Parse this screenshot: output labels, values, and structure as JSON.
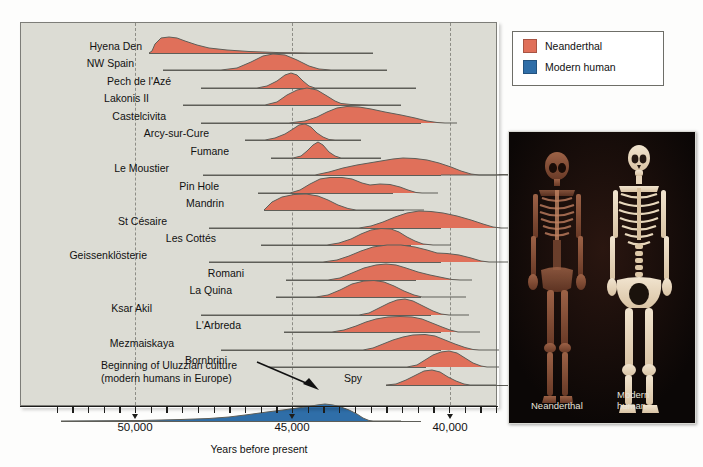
{
  "figure": {
    "axis_title": "Years before present",
    "background_color": "#dcdcd4",
    "neanderthal_color": "#e0705a",
    "modern_human_color": "#2f6ea8",
    "baseline_color": "#5e5e58"
  },
  "legend": {
    "items": [
      {
        "label": "Neanderthal",
        "color": "#e0705a"
      },
      {
        "label": "Modern human",
        "color": "#2f6ea8"
      }
    ]
  },
  "annotation": {
    "line1": "Beginning of Uluzzian culture",
    "line2": "(modern humans in Europe)"
  },
  "photo": {
    "left_caption": "Neanderthal",
    "right_caption_line1": "Modern",
    "right_caption_line2": "human"
  },
  "chart_data": {
    "type": "area",
    "title": "",
    "xlabel": "Years before present",
    "ylabel": "",
    "xlim": [
      52300,
      38600
    ],
    "x_reversed": true,
    "grid": true,
    "gridlines": [
      50000,
      45000,
      40000
    ],
    "tick_labels": [
      "50,000",
      "45,000",
      "40,000"
    ],
    "tick_values": [
      50000,
      45000,
      40000
    ],
    "minor_tick_interval": 500,
    "legend_position": "top-right",
    "series": [
      {
        "name": "Hyena Den",
        "group": "Neanderthal",
        "color": "#e0705a",
        "label_x": 123,
        "baseline": [
          128,
          352
        ],
        "peak": 49700,
        "points": "0,21 3,19 6,12 12,6 20,5 28,6 36,9 48,13 60,16 78,18 100,19.5 130,20.6 160,21 224,21"
      },
      {
        "name": "NW Spain",
        "group": "Neanderthal",
        "color": "#e0705a",
        "label_x": 115,
        "baseline": [
          142,
          366
        ],
        "peak": 47600,
        "points": "0,21 58,21 74,19 88,13 100,7 110,5 122,6 134,11 146,17 156,20 168,21 224,21"
      },
      {
        "name": "Pech de l'Azé",
        "group": "Neanderthal",
        "color": "#e0705a",
        "label_x": 152,
        "baseline": [
          180,
          395
        ],
        "peak": 47200,
        "points": "0,21 56,21 66,19 76,14 84,8 90,6 96,8 102,14 108,19 114,21 215,21"
      },
      {
        "name": "Lakonis II",
        "group": "Neanderthal",
        "color": "#e0705a",
        "label_x": 130,
        "baseline": [
          162,
          380
        ],
        "peak": 46500,
        "points": "0,21 82,21 94,18 104,11 114,6 124,4 134,6 144,12 152,17 158,19.5 168,20.5 186,21 218,21"
      },
      {
        "name": "Castelcivita",
        "group": "Neanderthal",
        "color": "#e0705a",
        "label_x": 147,
        "baseline": [
          180,
          400
        ],
        "peak": 45600,
        "points": "0,21 88,21 104,19 116,15 126,10 136,6 146,4.5 158,5 170,7 184,10 200,13 214,16 226,19 236,20.5 244,21 256,21"
      },
      {
        "name": "Arcy-sur-Cure",
        "group": "Neanderthal",
        "color": "#e0705a",
        "label_x": 190,
        "baseline": [
          224,
          340
        ],
        "peak": 45300,
        "points": "0,21 20,21 30,19 40,15 48,10 54,6 60,5 66,8 72,14 78,18 84,20.5 90,21 116,21"
      },
      {
        "name": "Fumane",
        "group": "Neanderthal",
        "color": "#e0705a",
        "label_x": 210,
        "baseline": [
          250,
          360
        ],
        "peak": 45200,
        "points": "0,21 22,21 30,19 36,14 42,8 47,5 52,8 58,15 64,19 70,21 110,21"
      },
      {
        "name": "Le Moustier",
        "group": "Neanderthal",
        "color": "#e0705a",
        "label_x": 150,
        "baseline": [
          182,
          420
        ],
        "peak": 44700,
        "points": "0,21 112,21 126,18 140,14 154,11 166,9 178,7 190,5 200,4 212,4.5 224,6 236,9 248,13 258,17 268,20 276,21 292,21 300,20.5 320,21 238,21"
      },
      {
        "name": "Pin Hole",
        "group": "Neanderthal",
        "color": "#e0705a",
        "label_x": 200,
        "baseline": [
          237,
          372
        ],
        "peak": 45000,
        "points": "0,21 32,21 42,18 52,12 62,7 72,5.5 84,5.5 94,7 104,11 112,13 122,12 132,12.5 142,15 150,18 158,20.5 164,21 180,21"
      },
      {
        "name": "Mandrin",
        "group": "Neanderthal",
        "color": "#e0705a",
        "label_x": 205,
        "baseline": [
          243,
          383
        ],
        "peak": 45500,
        "points": "0,21 2,19 8,13 18,8 30,5.5 42,5 54,7 64,11 74,16 84,19.5 92,21 160,21"
      },
      {
        "name": "St Césaire",
        "group": "Neanderthal",
        "color": "#e0705a",
        "label_x": 148,
        "baseline": [
          188,
          420
        ],
        "peak": 44500,
        "points": "0,21 150,21 162,19 174,15 186,10 198,6 210,4 222,4.5 234,6 248,9 262,13 274,17 284,20 292,21 310,21"
      },
      {
        "name": "Les Cottés",
        "group": "Neanderthal",
        "color": "#e0705a",
        "label_x": 197,
        "baseline": [
          240,
          390
        ],
        "peak": 44600,
        "points": "0,21 66,21 78,19 90,15 100,10 110,6 120,4.5 130,5 138,8 146,13 154,17 162,20 172,21 190,21"
      },
      {
        "name": "Geissenklösterie",
        "group": "Neanderthal",
        "color": "#e0705a",
        "label_x": 128,
        "baseline": [
          188,
          420
        ],
        "peak": 44500,
        "points": "0,21 114,21 128,19 140,15 152,10 164,6 178,4 192,4 206,6 218,9 228,12 238,12.5 250,14 262,17 272,20 280,21 300,21"
      },
      {
        "name": "Romani",
        "group": "Neanderthal",
        "color": "#e0705a",
        "label_x": 225,
        "baseline": [
          265,
          395
        ],
        "peak": 44200,
        "points": "0,21 42,21 54,19 66,14 78,9 90,6 100,5 110,6 120,9 132,13 144,16 156,18.5 166,20.5 174,21 186,21"
      },
      {
        "name": "La Quina",
        "group": "Neanderthal",
        "color": "#e0705a",
        "label_x": 213,
        "baseline": [
          255,
          400
        ],
        "peak": 44200,
        "points": "0,21 40,21 52,19 64,14 76,8 88,5 98,4.5 108,6 118,10 128,15 138,19 146,21 190,21"
      },
      {
        "name": "Ksar Akil",
        "group": "Neanderthal",
        "color": "#e0705a",
        "label_x": 133,
        "baseline": [
          180,
          410
        ],
        "peak": 44100,
        "points": "0,21 158,21 168,19 178,14 188,9 196,6 204,5 212,7 222,12 232,17 240,20 248,21 268,21"
      },
      {
        "name": "L'Arbreda",
        "group": "Neanderthal",
        "color": "#e0705a",
        "label_x": 222,
        "baseline": [
          263,
          420
        ],
        "peak": 43700,
        "points": "0,21 48,21 60,19 72,15 82,11 92,8 104,6 116,5.5 128,6 138,8 148,12 158,16 166,19 174,21 196,21"
      },
      {
        "name": "Mezmaiskaya",
        "group": "Neanderthal",
        "color": "#e0705a",
        "label_x": 155,
        "baseline": [
          200,
          420
        ],
        "peak": 42600,
        "points": "0,21 142,21 152,19 162,15 172,11 182,8 192,6 204,5.5 214,7 224,11 234,15 244,18.5 252,20.5 258,21 278,21"
      },
      {
        "name": "Bornbrini",
        "group": "Neanderthal",
        "color": "#e0705a",
        "label_x": 208,
        "baseline": [
          248,
          405
        ],
        "peak": 42400,
        "points": "0,21 138,21 148,19 156,14 164,9 172,6 180,5 188,7 196,12 204,17 212,20 218,21 230,21"
      },
      {
        "name": "Spy",
        "group": "Neanderthal",
        "color": "#e0705a",
        "label_x": 343,
        "baseline": [
          365,
          500
        ],
        "peak": 42100,
        "points": "0,21 10,20 20,16 30,11 38,7 46,6 54,8 62,13 70,17 78,20 84,21 110,21"
      },
      {
        "name": "Uluzzian",
        "group": "Modern human",
        "color": "#2f6ea8",
        "label_x": 0,
        "baseline": [
          40,
          400
        ],
        "peak": 45100,
        "points": "0,21 80,20.5 120,19.5 148,18.5 168,17 188,14.5 206,12 222,10 236,8 248,6.5 256,5 264,4 272,5 280,7 288,10 296,14 302,18 308,20.5 312,21 340,21"
      }
    ]
  },
  "axis": {
    "ticks": [
      {
        "value": 50000,
        "label": "50,000",
        "x": 135
      },
      {
        "value": 45000,
        "label": "45,000",
        "x": 292
      },
      {
        "value": 40000,
        "label": "40,000",
        "x": 450
      }
    ]
  }
}
